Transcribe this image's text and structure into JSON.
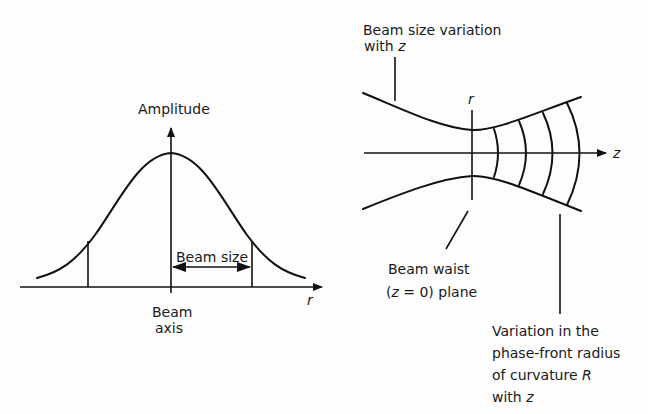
{
  "left_panel": {
    "y_axis_label": "Amplitude",
    "x_axis_label": "r",
    "beam_size_label": "Beam size",
    "beam_axis_label_line1": "Beam",
    "beam_axis_label_line2": "axis",
    "curve_type": "gaussian"
  },
  "right_panel": {
    "r_axis_label": "r",
    "z_axis_label": "z",
    "beam_size_variation_line1": "Beam size variation",
    "beam_size_variation_line2_prefix": "with ",
    "beam_size_variation_line2_var": "z",
    "beam_waist_line1": "Beam waist",
    "beam_waist_line2_open": "(",
    "beam_waist_line2_var": "z",
    "beam_waist_line2_rest": " = 0) plane",
    "curvature_line1": "Variation in the",
    "curvature_line2": "phase-front radius",
    "curvature_line3_prefix": "of curvature ",
    "curvature_line3_var": "R",
    "curvature_line4_prefix": "with ",
    "curvature_line4_var": "z",
    "phase_front_count": 4
  }
}
